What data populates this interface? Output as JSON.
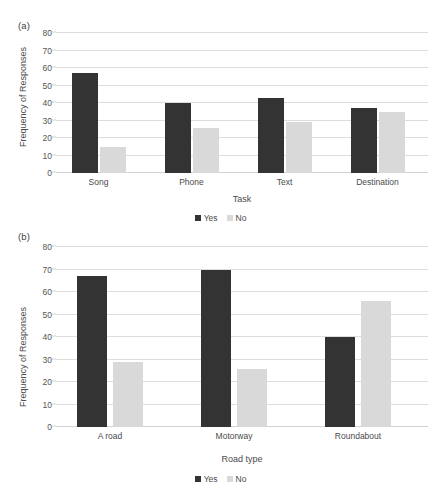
{
  "figure": {
    "background": "#ffffff",
    "series_colors": {
      "yes": "#333333",
      "no": "#d9d9d9"
    }
  },
  "panels": [
    {
      "panel_label": "(a)",
      "chart_data": {
        "type": "bar",
        "title": "",
        "categories": [
          "Song",
          "Phone",
          "Text",
          "Destination"
        ],
        "series": [
          {
            "name": "Yes",
            "values": [
              57,
              40,
              43,
              37
            ],
            "color": "#333333"
          },
          {
            "name": "No",
            "values": [
              15,
              26,
              29,
              35
            ],
            "color": "#d9d9d9"
          }
        ],
        "xlabel": "Task",
        "ylabel": "Frequency of Responses",
        "ylim": [
          0,
          80
        ],
        "yticks": [
          0,
          10,
          20,
          30,
          40,
          50,
          60,
          70,
          80
        ],
        "ytick_labels": [
          "0",
          "10",
          "20",
          "30",
          "40",
          "50",
          "60",
          "70",
          "80"
        ],
        "grid": true,
        "legend": [
          "Yes",
          "No"
        ],
        "legend_position": "bottom"
      }
    },
    {
      "panel_label": "(b)",
      "chart_data": {
        "type": "bar",
        "title": "",
        "categories": [
          "A road",
          "Motorway",
          "Roundabout"
        ],
        "series": [
          {
            "name": "Yes",
            "values": [
              67,
              70,
              40
            ],
            "color": "#333333"
          },
          {
            "name": "No",
            "values": [
              29,
              26,
              56
            ],
            "color": "#d9d9d9"
          }
        ],
        "xlabel": "Road type",
        "ylabel": "Frequency of Responses",
        "ylim": [
          0,
          80
        ],
        "yticks": [
          0,
          10,
          20,
          30,
          40,
          50,
          60,
          70,
          80
        ],
        "ytick_labels": [
          "0",
          "10",
          "20",
          "30",
          "40",
          "50",
          "60",
          "70",
          "80"
        ],
        "grid": true,
        "legend": [
          "Yes",
          "No"
        ],
        "legend_position": "bottom"
      }
    }
  ]
}
